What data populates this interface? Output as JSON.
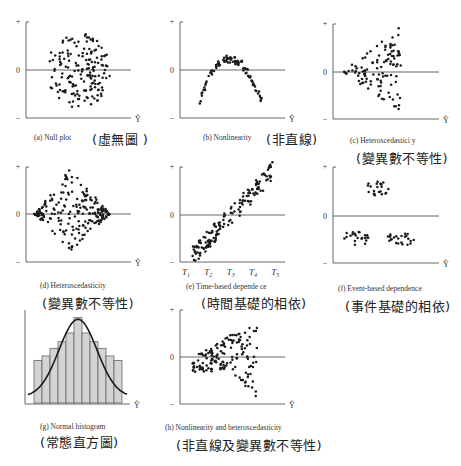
{
  "chart_data": [
    {
      "id": "a",
      "type": "scatter",
      "title": "(a) Null plot",
      "title_zh": "(虛無圖 )",
      "xlabel": "Ŷ",
      "yticks": [
        "+",
        "0",
        "–"
      ],
      "pattern": "uniform random band around zero",
      "shape": "ellipse",
      "params": {
        "cx": 0.5,
        "cy": 0.0,
        "rx": 0.3,
        "ry": 0.8,
        "n": 170
      }
    },
    {
      "id": "b",
      "type": "scatter",
      "title": "(b) Nonlinearity",
      "title_zh": "(非直線)",
      "xlabel": "Ŷ",
      "yticks": [
        "+",
        "0",
        "–"
      ],
      "pattern": "inverted U-shaped arc",
      "shape": "arc",
      "params": {
        "x0": 0.18,
        "x1": 0.78,
        "peak": 0.35,
        "ends": -0.6,
        "thick": 0.18,
        "n": 90
      }
    },
    {
      "id": "c",
      "type": "scatter",
      "title": "(c) Heteroscedastici y",
      "title_zh": "(變異數不等性)",
      "xlabel": "Ŷ",
      "yticks": [
        "+",
        "0",
        "–"
      ],
      "pattern": "fan widening to the right",
      "shape": "fan",
      "params": {
        "x0": 0.08,
        "x1": 0.64,
        "spread_top": 0.95,
        "spread_bot": -0.82,
        "n": 110
      }
    },
    {
      "id": "d",
      "type": "scatter",
      "title": "(d) Heteroscedasticity",
      "title_zh": "(變異數不等性)",
      "xlabel": "Ŷ",
      "yticks": [
        "+",
        "0",
        "–"
      ],
      "pattern": "diamond: variance largest in middle",
      "shape": "diamond",
      "params": {
        "x0": 0.08,
        "x1": 0.8,
        "xm": 0.42,
        "top": 0.98,
        "bot": -0.8,
        "n": 210
      }
    },
    {
      "id": "e",
      "type": "scatter",
      "title": "(e) Time-based depende ce",
      "title_zh": "(時間基礎的相依)",
      "xlabel": "",
      "xticks": [
        "T1",
        "T2",
        "T3",
        "T4",
        "T5"
      ],
      "yticks": [
        "+",
        "0",
        "–"
      ],
      "pattern": "rising diagonal band over time",
      "shape": "band",
      "params": {
        "x0": 0.12,
        "y0": -0.85,
        "x1": 0.88,
        "y1": 0.9,
        "width": 0.2,
        "n": 150
      }
    },
    {
      "id": "f",
      "type": "scatter",
      "title": "(f) Event-based dependence",
      "title_zh": "(事件基礎的相依)",
      "xlabel": "Ŷ",
      "yticks": [
        "+",
        "0",
        "–"
      ],
      "pattern": "three separate clusters",
      "shape": "clusters",
      "params": {
        "clusters": [
          {
            "cx": 0.42,
            "cy": 0.55,
            "rx": 0.13,
            "ry": 0.16,
            "n": 22
          },
          {
            "cx": 0.22,
            "cy": -0.45,
            "rx": 0.13,
            "ry": 0.16,
            "n": 22
          },
          {
            "cx": 0.64,
            "cy": -0.45,
            "rx": 0.13,
            "ry": 0.16,
            "n": 24
          }
        ]
      }
    },
    {
      "id": "g",
      "type": "bar",
      "title": "(g) Normal histogram",
      "title_zh": "(常態直方圖)",
      "xlabel": "Ŷ",
      "categories": [
        "1",
        "2",
        "3",
        "4",
        "5",
        "6",
        "7",
        "8",
        "9",
        "10",
        "11"
      ],
      "values": [
        39,
        43,
        50,
        56,
        64,
        78,
        64,
        56,
        50,
        43,
        39
      ],
      "overlay": "normal curve",
      "ylim": [
        0,
        85
      ]
    },
    {
      "id": "h",
      "type": "scatter",
      "title": "(h) Nonlinearity and heteroscedasticity",
      "title_zh": "(非直線及變異數不等性)",
      "xlabel": "Ŷ",
      "yticks": [
        "+",
        "0",
        "–"
      ],
      "pattern": "curved band widening to the right",
      "shape": "curvefan",
      "params": {
        "x0": 0.12,
        "x1": 0.74,
        "n": 150
      }
    }
  ],
  "colors": {
    "dots": "#1a1a1a",
    "axis": "#555555",
    "bar_fill": "#d4d4d4",
    "bar_edge": "#555555",
    "curve": "#1a1a1a"
  }
}
